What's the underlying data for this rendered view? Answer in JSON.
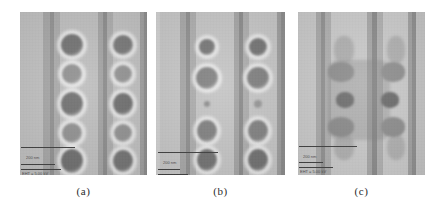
{
  "figure": {
    "background_color": "#ffffff",
    "panel_count": 3
  },
  "captions": [
    {
      "label": "(a)",
      "panel_id": "panel-a"
    },
    {
      "label": "(b)",
      "panel_id": "panel-b"
    },
    {
      "label": "(c)",
      "panel_id": "panel-c"
    }
  ],
  "panels": [
    {
      "id": "panel-a",
      "caption": "(a)",
      "frame": {
        "x": 20,
        "y": 12,
        "width": 127,
        "height": 163
      },
      "base_color": "#b4b4b4",
      "bands": [
        {
          "x": 0,
          "width": 23,
          "color": "#bdbdbd"
        },
        {
          "x": 23,
          "width": 7,
          "color": "#a3a3a3"
        },
        {
          "x": 30,
          "width": 4,
          "color": "#8f8f8f"
        },
        {
          "x": 34,
          "width": 6,
          "color": "#a8a8a8"
        },
        {
          "x": 40,
          "width": 38,
          "color": "#bcbcbc"
        },
        {
          "x": 78,
          "width": 5,
          "color": "#a0a0a0"
        },
        {
          "x": 83,
          "width": 4,
          "color": "#898989"
        },
        {
          "x": 87,
          "width": 6,
          "color": "#a9a9a9"
        },
        {
          "x": 93,
          "width": 27,
          "color": "#bdbdbd"
        },
        {
          "x": 120,
          "width": 4,
          "color": "#9c9c9c"
        },
        {
          "x": 124,
          "width": 3,
          "color": "#8a8a8a"
        }
      ],
      "blobs": [
        {
          "cx": 52,
          "cy": 33,
          "rx": 11,
          "ry": 11,
          "color": "#6d6d6d",
          "halo": true
        },
        {
          "cx": 52,
          "cy": 62,
          "rx": 10,
          "ry": 10,
          "color": "#8e8e8e",
          "halo": true
        },
        {
          "cx": 52,
          "cy": 92,
          "rx": 11,
          "ry": 12,
          "color": "#6c6c6c",
          "halo": true
        },
        {
          "cx": 52,
          "cy": 121,
          "rx": 10,
          "ry": 10,
          "color": "#8d8d8d",
          "halo": true
        },
        {
          "cx": 52,
          "cy": 149,
          "rx": 11,
          "ry": 12,
          "color": "#6a6a6a",
          "halo": true
        },
        {
          "cx": 103,
          "cy": 33,
          "rx": 10,
          "ry": 10,
          "color": "#737373",
          "halo": true
        },
        {
          "cx": 103,
          "cy": 62,
          "rx": 9,
          "ry": 9,
          "color": "#909090",
          "halo": true
        },
        {
          "cx": 103,
          "cy": 92,
          "rx": 10,
          "ry": 11,
          "color": "#6b6b6b",
          "halo": true
        },
        {
          "cx": 103,
          "cy": 121,
          "rx": 9,
          "ry": 9,
          "color": "#8e8e8e",
          "halo": true
        },
        {
          "cx": 103,
          "cy": 149,
          "rx": 10,
          "ry": 11,
          "color": "#6f6f6f",
          "halo": true
        }
      ],
      "annotations": {
        "scale_bar": {
          "x": 1,
          "y": 135,
          "width": 54
        },
        "ticks": [
          {
            "x": 1,
            "y": 152,
            "width": 34
          },
          {
            "x": 1,
            "y": 157,
            "width": 40
          }
        ],
        "labels": [
          {
            "text": "200 nm",
            "x": 6,
            "y": 144
          },
          {
            "text": "EHT = 5.00 kV",
            "x": 2,
            "y": 160
          }
        ]
      }
    },
    {
      "id": "panel-b",
      "caption": "(b)",
      "frame": {
        "x": 156,
        "y": 12,
        "width": 129,
        "height": 163
      },
      "base_color": "#bdbdbd",
      "bands": [
        {
          "x": 0,
          "width": 4,
          "color": "#cfcfcf"
        },
        {
          "x": 4,
          "width": 20,
          "color": "#c4c4c4"
        },
        {
          "x": 24,
          "width": 6,
          "color": "#a5a5a5"
        },
        {
          "x": 30,
          "width": 4,
          "color": "#8d8d8d"
        },
        {
          "x": 34,
          "width": 6,
          "color": "#ababab"
        },
        {
          "x": 40,
          "width": 38,
          "color": "#c3c3c3"
        },
        {
          "x": 78,
          "width": 5,
          "color": "#a2a2a2"
        },
        {
          "x": 83,
          "width": 4,
          "color": "#888888"
        },
        {
          "x": 87,
          "width": 6,
          "color": "#aaaaaa"
        },
        {
          "x": 93,
          "width": 28,
          "color": "#c3c3c3"
        },
        {
          "x": 121,
          "width": 4,
          "color": "#9b9b9b"
        },
        {
          "x": 125,
          "width": 4,
          "color": "#898989"
        }
      ],
      "blobs": [
        {
          "cx": 51,
          "cy": 35,
          "rx": 8,
          "ry": 8,
          "color": "#737373",
          "halo": true
        },
        {
          "cx": 51,
          "cy": 66,
          "rx": 11,
          "ry": 11,
          "color": "#7f7f7f",
          "halo": true
        },
        {
          "cx": 51,
          "cy": 92,
          "rx": 3,
          "ry": 3,
          "color": "#8a8a8a",
          "halo": false
        },
        {
          "cx": 51,
          "cy": 119,
          "rx": 10,
          "ry": 11,
          "color": "#7d7d7d",
          "halo": true
        },
        {
          "cx": 51,
          "cy": 148,
          "rx": 10,
          "ry": 11,
          "color": "#6e6e6e",
          "halo": true
        },
        {
          "cx": 102,
          "cy": 35,
          "rx": 9,
          "ry": 9,
          "color": "#6f6f6f",
          "halo": true
        },
        {
          "cx": 102,
          "cy": 66,
          "rx": 11,
          "ry": 11,
          "color": "#7c7c7c",
          "halo": true
        },
        {
          "cx": 102,
          "cy": 92,
          "rx": 4,
          "ry": 4,
          "color": "#939393",
          "halo": false
        },
        {
          "cx": 102,
          "cy": 119,
          "rx": 10,
          "ry": 11,
          "color": "#7d7d7d",
          "halo": true
        },
        {
          "cx": 102,
          "cy": 148,
          "rx": 10,
          "ry": 11,
          "color": "#6d6d6d",
          "halo": true
        }
      ],
      "annotations": {
        "scale_bar": {
          "x": 2,
          "y": 140,
          "width": 60
        },
        "ticks": [
          {
            "x": 2,
            "y": 157,
            "width": 22
          },
          {
            "x": 2,
            "y": 162,
            "width": 30
          }
        ],
        "labels": [
          {
            "text": "200 nm",
            "x": 7,
            "y": 149
          },
          {
            "text": "EHT = 5.00 kV",
            "x": 3,
            "y": 165
          }
        ]
      }
    },
    {
      "id": "panel-c",
      "caption": "(c)",
      "frame": {
        "x": 298,
        "y": 12,
        "width": 127,
        "height": 163
      },
      "base_color": "#c3c3c3",
      "bands": [
        {
          "x": 0,
          "width": 18,
          "color": "#c6c6c6"
        },
        {
          "x": 18,
          "width": 5,
          "color": "#a6a6a6"
        },
        {
          "x": 23,
          "width": 4,
          "color": "#8e8e8e"
        },
        {
          "x": 27,
          "width": 6,
          "color": "#acacac"
        },
        {
          "x": 33,
          "width": 36,
          "color": "#c8c8c8"
        },
        {
          "x": 69,
          "width": 5,
          "color": "#a4a4a4"
        },
        {
          "x": 74,
          "width": 5,
          "color": "#878787"
        },
        {
          "x": 79,
          "width": 6,
          "color": "#adadad"
        },
        {
          "x": 85,
          "width": 25,
          "color": "#c8c8c8"
        },
        {
          "x": 110,
          "width": 4,
          "color": "#9e9e9e"
        },
        {
          "x": 114,
          "width": 4,
          "color": "#8b8b8b"
        },
        {
          "x": 118,
          "width": 9,
          "color": "#c0c0c0"
        }
      ],
      "overlay": {
        "x": 30,
        "y": 48,
        "width": 62,
        "height": 80,
        "color": "rgba(118,118,118,0.30)"
      },
      "faint_blobs": [
        {
          "cx": 46,
          "cy": 38,
          "rx": 10,
          "ry": 14,
          "color": "rgba(150,150,150,0.55)"
        },
        {
          "cx": 98,
          "cy": 38,
          "rx": 9,
          "ry": 14,
          "color": "rgba(152,152,152,0.55)"
        },
        {
          "cx": 46,
          "cy": 135,
          "rx": 10,
          "ry": 13,
          "color": "rgba(150,150,150,0.55)"
        },
        {
          "cx": 98,
          "cy": 135,
          "rx": 9,
          "ry": 13,
          "color": "rgba(152,152,152,0.55)"
        }
      ],
      "lobes": [
        {
          "cx": 43,
          "cy": 60,
          "rx": 13,
          "ry": 10,
          "color": "#8a8a8a"
        },
        {
          "cx": 95,
          "cy": 60,
          "rx": 12,
          "ry": 10,
          "color": "#8c8c8c"
        },
        {
          "cx": 43,
          "cy": 115,
          "rx": 13,
          "ry": 10,
          "color": "#878787"
        },
        {
          "cx": 95,
          "cy": 115,
          "rx": 12,
          "ry": 10,
          "color": "#8a8a8a"
        },
        {
          "cx": 47,
          "cy": 88,
          "rx": 9,
          "ry": 8,
          "color": "#6a6a6a"
        },
        {
          "cx": 92,
          "cy": 88,
          "rx": 9,
          "ry": 8,
          "color": "#686868"
        }
      ],
      "annotations": {
        "scale_bar": {
          "x": 1,
          "y": 134,
          "width": 58
        },
        "ticks": [
          {
            "x": 1,
            "y": 150,
            "width": 24
          },
          {
            "x": 1,
            "y": 155,
            "width": 34
          }
        ],
        "labels": [
          {
            "text": "200 nm",
            "x": 5,
            "y": 143
          },
          {
            "text": "EHT = 5.00 kV",
            "x": 2,
            "y": 158
          }
        ]
      }
    }
  ]
}
